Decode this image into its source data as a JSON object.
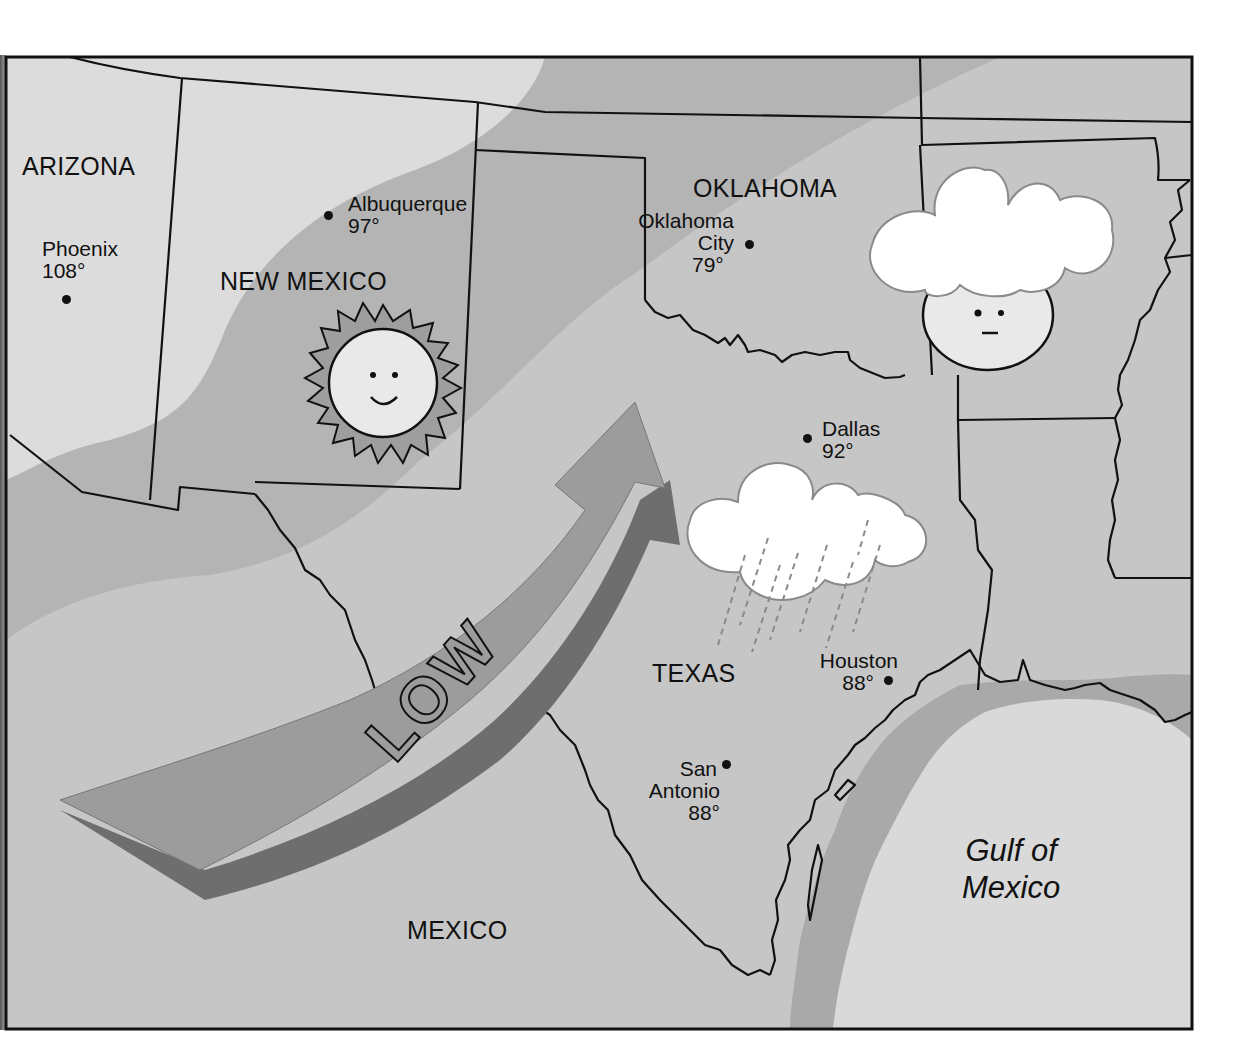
{
  "map": {
    "title_type": "weather map",
    "colors": {
      "frame": "#111111",
      "region_light": "#dcdcdc",
      "region_mid": "#b4b4b4",
      "region_band": "#c6c6c6",
      "shelf": "#a9a9a9",
      "gulf": "#d9d9d9",
      "arrow_face": "#9c9c9c",
      "arrow_side": "#6e6e6e",
      "cloud": "#ffffff",
      "background": "#ffffff"
    },
    "regions": [
      {
        "id": "arizona",
        "label": "ARIZONA"
      },
      {
        "id": "new-mexico",
        "label": "NEW MEXICO"
      },
      {
        "id": "oklahoma",
        "label": "OKLAHOMA"
      },
      {
        "id": "texas",
        "label": "TEXAS"
      },
      {
        "id": "mexico",
        "label": "MEXICO"
      }
    ],
    "water": {
      "label_line1": "Gulf of",
      "label_line2": "Mexico"
    },
    "cities": [
      {
        "id": "phoenix",
        "name": "Phoenix",
        "temp": "108°"
      },
      {
        "id": "albuquerque",
        "name": "Albuquerque",
        "temp": "97°"
      },
      {
        "id": "oklahoma-city",
        "name_line1": "Oklahoma",
        "name_line2": "City",
        "temp": "79°"
      },
      {
        "id": "dallas",
        "name": "Dallas",
        "temp": "92°"
      },
      {
        "id": "houston",
        "name": "Houston",
        "temp": "88°"
      },
      {
        "id": "san-antonio",
        "name_line1": "San",
        "name_line2": "Antonio",
        "temp": "88°"
      }
    ],
    "pressure_system": {
      "label": "LOW",
      "icon": "curved-arrow-icon"
    },
    "weather_icons": [
      {
        "id": "sun",
        "icon": "sun-smiling-icon",
        "location": "New Mexico"
      },
      {
        "id": "cloud-cover",
        "icon": "cloud-covered-sun-icon",
        "location": "Arkansas"
      },
      {
        "id": "rain",
        "icon": "rain-cloud-icon",
        "location": "Texas"
      }
    ]
  }
}
